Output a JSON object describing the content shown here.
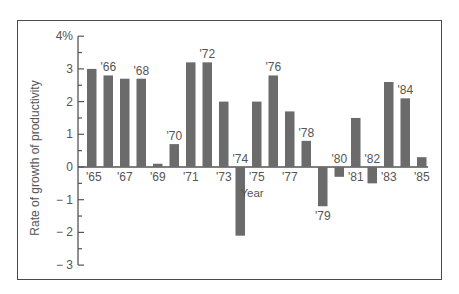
{
  "chart_data": {
    "type": "bar",
    "title": "",
    "xlabel": "Year",
    "ylabel": "Rate of growth of productivity",
    "ylim": [
      -3,
      4
    ],
    "yticks": [
      "4%",
      "3",
      "2",
      "1",
      "0",
      "-1",
      "-2",
      "-3"
    ],
    "grid": false,
    "legend": null,
    "categories": [
      "'65",
      "'66",
      "'67",
      "'68",
      "'69",
      "'70",
      "'71",
      "'72",
      "'73",
      "'74",
      "'75",
      "'76",
      "'77",
      "'78",
      "'79",
      "'80",
      "'81",
      "'82",
      "'83",
      "'84",
      "'85"
    ],
    "values": [
      3.0,
      2.8,
      2.7,
      2.7,
      0.1,
      0.7,
      3.2,
      3.2,
      2.0,
      -2.1,
      2.0,
      2.8,
      1.7,
      0.8,
      -1.2,
      -0.3,
      1.5,
      -0.5,
      2.6,
      2.1,
      0.3
    ],
    "label_positions": [
      "below-axis",
      "above-bar",
      "below-axis",
      "above-bar",
      "below-axis",
      "above-bar",
      "below-axis",
      "above-bar",
      "below-axis",
      "above-axis",
      "below-axis",
      "above-bar",
      "below-axis",
      "above-bar",
      "below-bar",
      "above-axis",
      "below-axis",
      "above-axis",
      "below-axis",
      "above-bar",
      "below-axis"
    ],
    "bar_color": "#6b6b6b"
  }
}
